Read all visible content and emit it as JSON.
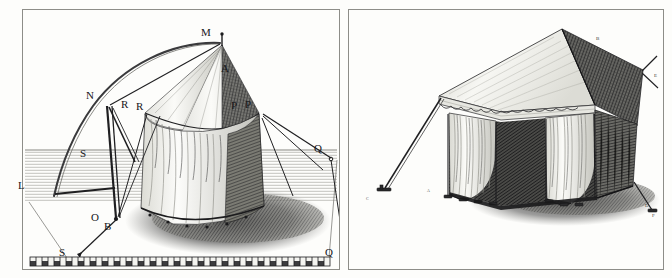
{
  "plate": {
    "title": "Engraved plate: two military tent designs",
    "background_color": "#fdfdfb",
    "ink_color": "#17171a",
    "frame_color": "#8d8d88"
  },
  "left_panel": {
    "name": "conical-bell-tent-geometric-construction",
    "description": "Conical pavilion tent with geometric construction arc, guy ropes and ground scale",
    "labels": [
      {
        "key": "M",
        "text": "M",
        "x": 201,
        "y": 27,
        "size": "lg",
        "note": "apex finial of cone"
      },
      {
        "key": "A",
        "text": "A",
        "x": 221,
        "y": 63,
        "size": "lg",
        "note": "cone surface"
      },
      {
        "key": "N",
        "text": "N",
        "x": 86,
        "y": 90,
        "size": "lg",
        "note": "arc intersection left pole"
      },
      {
        "key": "R1",
        "text": "R",
        "x": 121,
        "y": 99,
        "size": "lg",
        "note": "eave point left"
      },
      {
        "key": "R2",
        "text": "R",
        "x": 136,
        "y": 101,
        "size": "lg",
        "note": "eave point left inner"
      },
      {
        "key": "P1",
        "text": "P",
        "x": 231,
        "y": 100,
        "size": "lg",
        "note": "eave point right inner"
      },
      {
        "key": "P2",
        "text": "P",
        "x": 245,
        "y": 99,
        "size": "lg",
        "note": "eave point right"
      },
      {
        "key": "S1",
        "text": "S",
        "x": 80,
        "y": 148,
        "size": "lg",
        "note": "brace midpoint"
      },
      {
        "key": "L",
        "text": "L",
        "x": 18,
        "y": 180,
        "size": "lg",
        "note": "horizon base line left"
      },
      {
        "key": "Q1",
        "text": "Q",
        "x": 314,
        "y": 143,
        "size": "lg",
        "note": "guy rope anchor right"
      },
      {
        "key": "O",
        "text": "O",
        "x": 91,
        "y": 212,
        "size": "lg",
        "note": "foot of main pole"
      },
      {
        "key": "B",
        "text": "B",
        "x": 104,
        "y": 221,
        "size": "lg",
        "note": "ground ring of tent"
      },
      {
        "key": "S2",
        "text": "S",
        "x": 59,
        "y": 247,
        "size": "lg",
        "note": "stake on scale bar left"
      },
      {
        "key": "Q2",
        "text": "Q",
        "x": 325,
        "y": 247,
        "size": "lg",
        "note": "stake on scale bar right"
      }
    ]
  },
  "right_panel": {
    "name": "rectangular-marquee-tent",
    "description": "Rectangular ridge marquee tent with open draped curtains, valance and guy ropes",
    "labels": [
      {
        "key": "B",
        "text": "B",
        "x": 596,
        "y": 36,
        "size": "sm",
        "note": "ridge peak"
      },
      {
        "key": "E",
        "text": "E",
        "x": 654,
        "y": 73,
        "size": "sm",
        "note": "upper right guy rope"
      },
      {
        "key": "A",
        "text": "A",
        "x": 427,
        "y": 189,
        "size": "xs",
        "note": "front left corner post"
      },
      {
        "key": "C",
        "text": "C",
        "x": 366,
        "y": 197,
        "size": "xs",
        "note": "left stake"
      },
      {
        "key": "D",
        "text": "D",
        "x": 645,
        "y": 203,
        "size": "sm",
        "note": "right guy rope"
      },
      {
        "key": "F",
        "text": "F",
        "x": 652,
        "y": 213,
        "size": "sm",
        "note": "right stake"
      }
    ]
  }
}
